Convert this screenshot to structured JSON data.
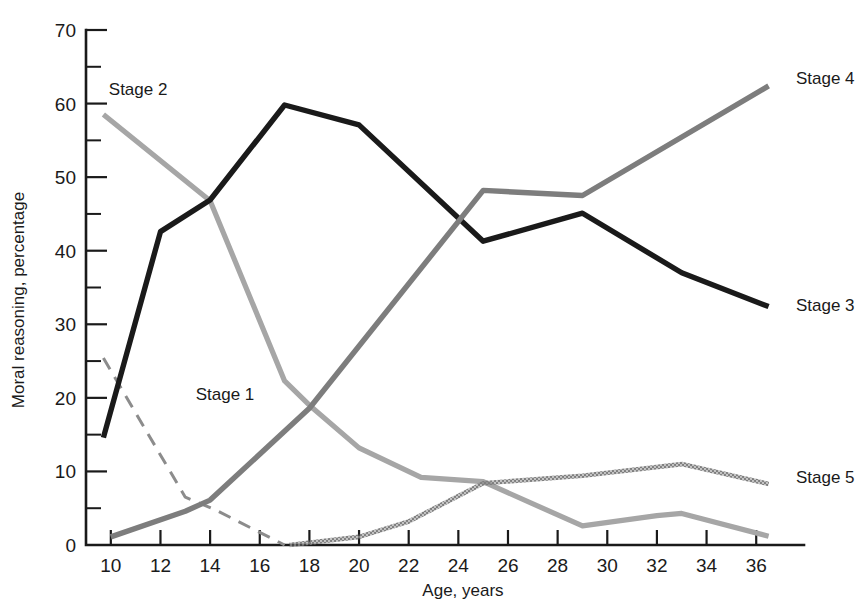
{
  "chart_data": {
    "type": "line",
    "title": "",
    "xlabel": "Age, years",
    "ylabel": "Moral reasoning, percentage",
    "xlim": [
      9,
      37.2
    ],
    "ylim": [
      0,
      70
    ],
    "grid": false,
    "legend": "inline-labels",
    "x_ticks": [
      10,
      12,
      14,
      16,
      18,
      20,
      22,
      24,
      26,
      28,
      30,
      32,
      34,
      36
    ],
    "x_tick_labels": [
      "10",
      "12",
      "14",
      "16",
      "18",
      "20",
      "22",
      "24",
      "26",
      "28",
      "30",
      "32",
      "34",
      "36"
    ],
    "y_ticks": [
      0,
      10,
      20,
      30,
      40,
      50,
      60,
      70
    ],
    "y_tick_labels": [
      "0",
      "10",
      "20",
      "30",
      "40",
      "50",
      "60",
      "70"
    ],
    "y_minor_ticks": [
      5,
      15,
      25,
      35,
      45,
      55,
      65
    ],
    "series": [
      {
        "name": "Stage 1",
        "style": "dashed",
        "color": "#8c8c8c",
        "width": 3.0,
        "label_x": 14.6,
        "label_y": 20.5,
        "label_anchor": "middle",
        "x": [
          9.7,
          13.0,
          14.2,
          17.0
        ],
        "values": [
          25.4,
          6.5,
          4.8,
          0.0
        ]
      },
      {
        "name": "Stage 2",
        "style": "solid",
        "color": "#a6a6a6",
        "width": 5.2,
        "label_x": 11.1,
        "label_y": 62.0,
        "label_anchor": "middle",
        "x": [
          9.7,
          14.0,
          17.0,
          18.0,
          20.0,
          22.5,
          25.0,
          29.0,
          32.0,
          33.0,
          36.5
        ],
        "values": [
          58.5,
          46.8,
          22.3,
          19.0,
          13.2,
          9.2,
          8.6,
          2.6,
          4.0,
          4.3,
          1.2
        ]
      },
      {
        "name": "Stage 3",
        "style": "solid",
        "color": "#1a1a1a",
        "width": 5.4,
        "label_x": 37.6,
        "label_y": 32.6,
        "label_anchor": "start",
        "x": [
          9.7,
          12.0,
          14.0,
          17.0,
          20.0,
          25.0,
          29.0,
          33.0,
          36.5
        ],
        "values": [
          14.6,
          42.6,
          46.9,
          59.8,
          57.1,
          41.3,
          45.1,
          37.0,
          32.4
        ]
      },
      {
        "name": "Stage 4",
        "style": "solid",
        "color": "#7d7d7d",
        "width": 5.4,
        "label_x": 37.6,
        "label_y": 63.5,
        "label_anchor": "start",
        "x": [
          10.0,
          13.0,
          14.0,
          18.0,
          25.0,
          29.0,
          36.5
        ],
        "values": [
          1.1,
          4.6,
          6.1,
          18.6,
          48.2,
          47.5,
          62.4
        ]
      },
      {
        "name": "Stage 5",
        "style": "dotted-halftone",
        "color": "#7d7d7d",
        "width": 4.6,
        "label_x": 37.6,
        "label_y": 9.2,
        "label_anchor": "start",
        "x": [
          17.2,
          20.0,
          22.0,
          25.0,
          29.0,
          33.0,
          36.5
        ],
        "values": [
          0.0,
          1.1,
          3.2,
          8.4,
          9.4,
          11.0,
          8.3
        ]
      }
    ]
  }
}
